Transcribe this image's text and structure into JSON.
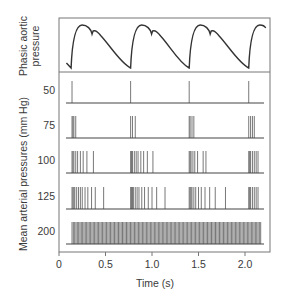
{
  "figure": {
    "aortic_label_line1": "Phasic aortic",
    "aortic_label_line2": "pressure",
    "ylabel": "Mean arterial pressures (mm Hg)",
    "xlabel": "Time (s)",
    "x_ticks": [
      "0",
      "0.5",
      "1.0",
      "1.5",
      "2.0"
    ]
  },
  "colors": {
    "frame": "#777777",
    "trace": "#333333",
    "spike": "#555555",
    "baseline": "#444444",
    "text": "#3a3a3a"
  },
  "chart_data": {
    "type": "line",
    "title": "",
    "xlabel": "Time (s)",
    "ylabel": "Mean arterial pressures (mm Hg)",
    "xlim": [
      0,
      2.25
    ],
    "x_ticks": [
      0,
      0.5,
      1.0,
      1.5,
      2.0
    ],
    "grid": false,
    "legend": "none",
    "panels": [
      {
        "name": "Phasic aortic pressure",
        "type": "line",
        "description": "Periodic arterial pressure waveform with dicrotic notch; beats begin at ~0.13, 0.77, 1.40, 2.04 s (period ~0.63 s)",
        "beat_onsets_s": [
          0.13,
          0.77,
          1.4,
          2.04
        ]
      },
      {
        "name": "Baroreceptor spike trains",
        "type": "raster",
        "series": [
          {
            "name": "50",
            "spikes_s": [
              0.14,
              0.77,
              1.4,
              2.04
            ]
          },
          {
            "name": "75",
            "spikes_s": [
              0.14,
              0.15,
              0.16,
              0.18,
              0.77,
              0.79,
              0.82,
              1.4,
              1.41,
              1.43,
              1.45,
              2.04,
              2.06,
              2.08,
              2.1
            ]
          },
          {
            "name": "100",
            "spikes_s": [
              0.14,
              0.15,
              0.16,
              0.18,
              0.2,
              0.23,
              0.26,
              0.3,
              0.37,
              0.77,
              0.78,
              0.79,
              0.81,
              0.83,
              0.85,
              0.88,
              0.91,
              0.95,
              1.01,
              1.4,
              1.41,
              1.42,
              1.44,
              1.46,
              1.49,
              1.55,
              1.58,
              2.04,
              2.05,
              2.06,
              2.08,
              2.1,
              2.12,
              2.14
            ]
          },
          {
            "name": "125",
            "spikes_s": [
              0.14,
              0.15,
              0.16,
              0.17,
              0.19,
              0.21,
              0.23,
              0.25,
              0.28,
              0.31,
              0.35,
              0.39,
              0.48,
              0.77,
              0.78,
              0.79,
              0.8,
              0.82,
              0.84,
              0.86,
              0.89,
              0.92,
              0.96,
              1.0,
              1.05,
              1.14,
              1.4,
              1.41,
              1.42,
              1.43,
              1.45,
              1.47,
              1.5,
              1.53,
              1.57,
              1.62,
              1.68,
              1.79,
              2.04,
              2.05,
              2.06,
              2.08,
              2.1,
              2.12,
              2.14
            ]
          },
          {
            "name": "200",
            "spike_rate_hz": 70,
            "spike_range_s": [
              0.14,
              2.18
            ],
            "description": "continuous high-frequency firing"
          }
        ]
      }
    ]
  }
}
